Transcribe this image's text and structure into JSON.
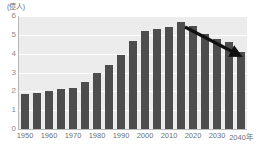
{
  "chart_data": {
    "type": "bar",
    "title": "",
    "subtitle": "",
    "xlabel": "",
    "ylabel": "",
    "unit_label": "(億人)",
    "x_axis_suffix": "年",
    "categories": [
      "1950",
      "1955",
      "1960",
      "1965",
      "1970",
      "1975",
      "1980",
      "1985",
      "1990",
      "1995",
      "2000",
      "2005",
      "2010",
      "2015",
      "2020",
      "2025",
      "2030",
      "2035",
      "2040"
    ],
    "values": [
      1.85,
      1.9,
      2.0,
      2.1,
      2.2,
      2.5,
      3.0,
      3.4,
      3.95,
      4.65,
      5.2,
      5.3,
      5.4,
      5.7,
      5.45,
      5.05,
      4.8,
      4.6,
      4.1
    ],
    "x_tick_labels": [
      "1950",
      "1960",
      "1970",
      "1980",
      "1990",
      "2000",
      "2010",
      "2020",
      "2030",
      "2040年"
    ],
    "x_tick_categories": [
      "1950",
      "1960",
      "1970",
      "1980",
      "1990",
      "2000",
      "2010",
      "2020",
      "2030",
      "2040"
    ],
    "y_ticks": [
      0,
      1,
      2,
      3,
      4,
      5,
      6
    ],
    "ylim": [
      0,
      6
    ],
    "grid": true,
    "grid_axis": "y",
    "legend": false,
    "annotations": [
      {
        "name": "decline-arrow",
        "type": "arrow",
        "from_x": 185,
        "from_y": 27,
        "to_x": 235,
        "to_y": 53,
        "color": "#111111"
      }
    ],
    "colors": {
      "bar": "#4d4d4d",
      "plot_background": "#ececec",
      "gridline": "#ffffff",
      "axis": "#b9b9b9",
      "tick_text": "#8a8a8a",
      "label_text": "#6f6f6f",
      "arrow": "#111111"
    }
  }
}
